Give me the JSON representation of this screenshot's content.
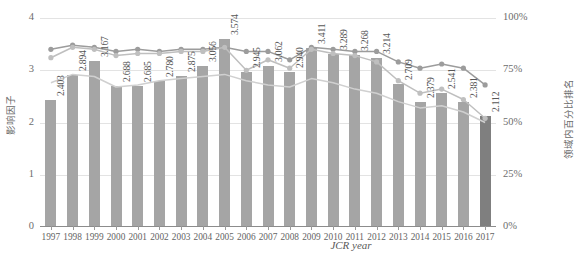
{
  "chart_data": {
    "type": "bar",
    "title": "",
    "subtitle": "",
    "xlabel": "JCR year",
    "ylabel": "影响因子",
    "y2label": "领域内百分比排名",
    "categories": [
      "1997",
      "1998",
      "1999",
      "2000",
      "2001",
      "2002",
      "2003",
      "2004",
      "2005",
      "2006",
      "2007",
      "2008",
      "2009",
      "2010",
      "2011",
      "2012",
      "2013",
      "2014",
      "2015",
      "2016",
      "2017"
    ],
    "ylim": [
      0,
      4
    ],
    "yticks": [
      "0",
      "1",
      "2",
      "3",
      "4"
    ],
    "y2lim": [
      0,
      100
    ],
    "y2ticks": [
      "0%",
      "25%",
      "50%",
      "75%",
      "100%"
    ],
    "grid": true,
    "legend_position": "bottom",
    "series": [
      {
        "name": "影响因子",
        "type": "bar",
        "axis": "left",
        "values": [
          2.403,
          2.894,
          3.167,
          2.688,
          2.685,
          2.78,
          2.875,
          3.056,
          3.574,
          2.945,
          3.062,
          2.94,
          3.411,
          3.289,
          3.268,
          3.214,
          2.709,
          2.379,
          2.541,
          2.381,
          2.112
        ],
        "labels": [
          "2.403",
          "2.894",
          "3.167",
          "2.688",
          "2.685",
          "2.780",
          "2.875",
          "3.056",
          "3.574",
          "2.945",
          "3.062",
          "2.940",
          "3.411",
          "3.289",
          "3.268",
          "3.214",
          "2.709",
          "2.379",
          "2.541",
          "2.381",
          "2.112"
        ],
        "color": "#a5a5a5",
        "highlight_index": 20,
        "highlight_color": "#7f7f7f"
      },
      {
        "name": "领域内百分比排名 (系列一)",
        "type": "line",
        "axis": "right",
        "values": [
          85,
          87,
          86,
          84,
          85,
          84,
          85,
          85,
          86,
          84,
          84,
          80,
          86,
          85,
          84,
          84,
          79,
          76,
          78,
          76,
          68
        ],
        "color": "#9c9c9c",
        "marker": "circle"
      },
      {
        "name": "领域内百分比排名 (系列二)",
        "type": "line",
        "axis": "right",
        "values": [
          81,
          86,
          85,
          82,
          83,
          83,
          84,
          84,
          86,
          75,
          80,
          76,
          85,
          83,
          82,
          79,
          70,
          64,
          66,
          61,
          52
        ],
        "color": "#bfbfbf",
        "marker": "circle"
      },
      {
        "name": "领域内百分比排名 (系列三)",
        "type": "line",
        "axis": "right",
        "values": [
          69,
          73,
          72,
          67,
          68,
          70,
          71,
          72,
          73,
          70,
          68,
          67,
          71,
          69,
          66,
          64,
          60,
          57,
          58,
          55,
          50
        ],
        "color": "#d0d0d0",
        "marker": "none"
      }
    ]
  }
}
